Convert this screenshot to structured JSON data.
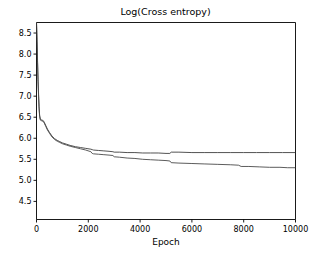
{
  "chart_data": {
    "type": "line",
    "title": "Log(Cross entropy)",
    "xlabel": "Epoch",
    "ylabel": "",
    "xlim": [
      0,
      10000
    ],
    "ylim": [
      4.07,
      8.75
    ],
    "grid": false,
    "legend": null,
    "xticks": [
      0,
      2000,
      4000,
      6000,
      8000,
      10000
    ],
    "xtick_labels": [
      "0",
      "2000",
      "4000",
      "6000",
      "8000",
      "10000"
    ],
    "yticks": [
      4.5,
      5.0,
      5.5,
      6.0,
      6.5,
      7.0,
      7.5,
      8.0,
      8.5
    ],
    "ytick_labels": [
      "4.5",
      "5.0",
      "5.5",
      "6.0",
      "6.5",
      "7.0",
      "7.5",
      "8.0",
      "8.5"
    ],
    "series": [
      {
        "name": "curve-upper",
        "color": "#3f3f3f",
        "x": [
          0,
          20,
          40,
          60,
          80,
          100,
          120,
          150,
          180,
          220,
          260,
          300,
          360,
          420,
          500,
          600,
          700,
          800,
          900,
          1000,
          1150,
          1300,
          1500,
          1700,
          1900,
          2100,
          2150,
          2200,
          2400,
          2600,
          2800,
          2950,
          3000,
          3200,
          3500,
          3800,
          4100,
          4400,
          4700,
          5000,
          5150,
          5200,
          5500,
          6000,
          6500,
          7000,
          7500,
          8000,
          8500,
          9000,
          9500,
          10000
        ],
        "y": [
          8.75,
          8.35,
          7.85,
          7.4,
          7.05,
          6.75,
          6.55,
          6.45,
          6.44,
          6.43,
          6.42,
          6.38,
          6.3,
          6.22,
          6.14,
          6.05,
          5.99,
          5.95,
          5.92,
          5.89,
          5.86,
          5.83,
          5.8,
          5.78,
          5.76,
          5.74,
          5.73,
          5.72,
          5.71,
          5.7,
          5.69,
          5.68,
          5.67,
          5.67,
          5.66,
          5.66,
          5.65,
          5.65,
          5.65,
          5.64,
          5.64,
          5.67,
          5.67,
          5.66,
          5.66,
          5.66,
          5.66,
          5.66,
          5.66,
          5.66,
          5.66,
          5.66
        ]
      },
      {
        "name": "curve-lower",
        "color": "#4a4a4a",
        "x": [
          0,
          20,
          40,
          60,
          80,
          100,
          120,
          150,
          180,
          220,
          260,
          300,
          360,
          420,
          500,
          600,
          700,
          800,
          900,
          1000,
          1150,
          1300,
          1500,
          1700,
          1900,
          2100,
          2150,
          2200,
          2400,
          2600,
          2800,
          2950,
          3000,
          3200,
          3500,
          3800,
          4100,
          4400,
          4700,
          5000,
          5150,
          5200,
          5500,
          6000,
          6500,
          7000,
          7500,
          7800,
          7900,
          8200,
          8600,
          9000,
          9400,
          9700,
          10000
        ],
        "y": [
          8.75,
          8.3,
          7.8,
          7.35,
          7.0,
          6.7,
          6.52,
          6.43,
          6.42,
          6.41,
          6.4,
          6.36,
          6.28,
          6.2,
          6.12,
          6.03,
          5.97,
          5.93,
          5.9,
          5.87,
          5.84,
          5.81,
          5.78,
          5.75,
          5.72,
          5.68,
          5.64,
          5.63,
          5.62,
          5.61,
          5.6,
          5.59,
          5.56,
          5.55,
          5.53,
          5.52,
          5.5,
          5.49,
          5.48,
          5.47,
          5.46,
          5.42,
          5.41,
          5.4,
          5.39,
          5.38,
          5.37,
          5.36,
          5.33,
          5.33,
          5.32,
          5.31,
          5.31,
          5.3,
          5.3
        ]
      }
    ]
  }
}
